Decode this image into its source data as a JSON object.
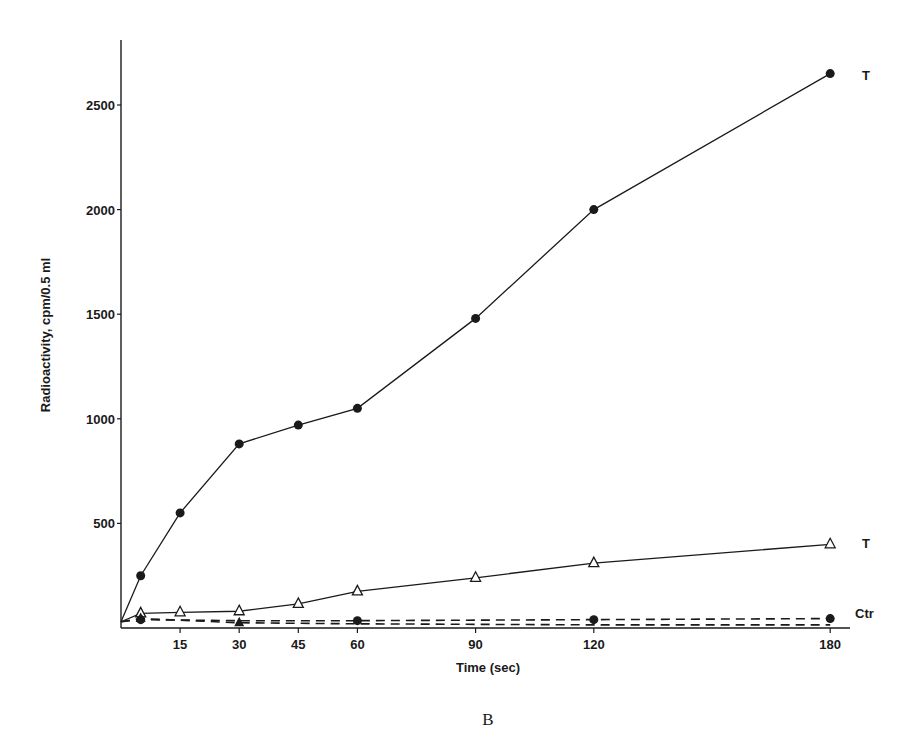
{
  "panel_label": "B",
  "chart_data": {
    "type": "line",
    "title": "",
    "xlabel": "Time (sec)",
    "ylabel": "Radioactivity, cpm/0.5 ml",
    "xlim": [
      0,
      180
    ],
    "ylim": [
      0,
      2700
    ],
    "xticks": [
      15,
      30,
      45,
      60,
      90,
      120,
      180
    ],
    "yticks": [
      500,
      1000,
      1500,
      2000,
      2500
    ],
    "grid": false,
    "series": [
      {
        "name": "T (filled circles)",
        "label": "T",
        "marker": "filled-circle",
        "line": "solid",
        "x": [
          0,
          5,
          15,
          30,
          45,
          60,
          90,
          120,
          180
        ],
        "values": [
          30,
          250,
          550,
          880,
          970,
          1050,
          1480,
          2000,
          2650
        ]
      },
      {
        "name": "T (open triangles)",
        "label": "T",
        "marker": "open-triangle",
        "line": "solid",
        "x": [
          0,
          5,
          15,
          30,
          45,
          60,
          90,
          120,
          180
        ],
        "values": [
          30,
          70,
          75,
          80,
          115,
          175,
          240,
          310,
          400
        ]
      },
      {
        "name": "Ctr (filled circles)",
        "label": "Ctr",
        "marker": "filled-circle",
        "line": "dashed",
        "x": [
          0,
          5,
          30,
          60,
          120,
          180
        ],
        "values": [
          30,
          40,
          35,
          35,
          40,
          45
        ]
      },
      {
        "name": "Ctr (open triangles)",
        "label": "",
        "marker": "filled-triangle",
        "line": "dashed",
        "x": [
          0,
          5,
          30,
          60,
          120,
          180
        ],
        "values": [
          30,
          45,
          25,
          20,
          15,
          15
        ]
      }
    ],
    "annotations": [
      "T",
      "T",
      "Ctr"
    ]
  }
}
